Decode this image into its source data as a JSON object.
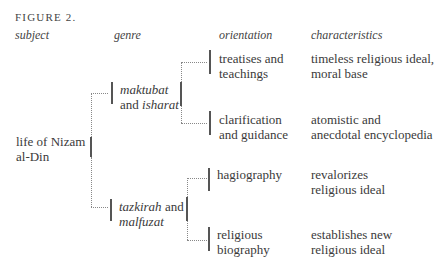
{
  "figure": {
    "title": "FIGURE 2."
  },
  "columns": {
    "subject": "subject",
    "genre": "genre",
    "orientation": "orientation",
    "characteristics": "characteristics"
  },
  "subject": {
    "line1": "life of Nizam",
    "line2": "al-Din"
  },
  "genres": [
    {
      "line1_italic": "maktubat",
      "line2_plain": "and ",
      "line2_italic": "isharat"
    },
    {
      "line1_italic": "tazkirah",
      "line1_plain": " and",
      "line2_italic": "malfuzat"
    }
  ],
  "orientations": [
    {
      "line1": "treatises and",
      "line2": "teachings"
    },
    {
      "line1": "clarification",
      "line2": "and guidance"
    },
    {
      "line1": "hagiography",
      "line2": ""
    },
    {
      "line1": "religious",
      "line2": "biography"
    }
  ],
  "characteristics": [
    {
      "line1": "timeless religious ideal,",
      "line2": "moral base"
    },
    {
      "line1": "atomistic and",
      "line2": "anecdotal encyclopedia"
    },
    {
      "line1": "revalorizes",
      "line2": "religious ideal"
    },
    {
      "line1": "establishes new",
      "line2": "religious ideal"
    }
  ]
}
